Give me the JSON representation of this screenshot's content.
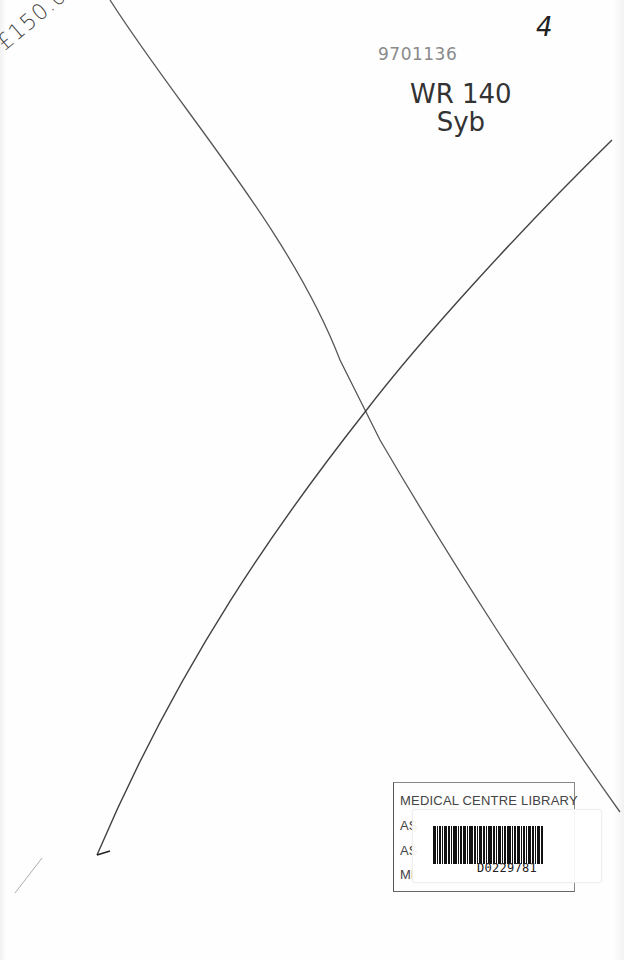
{
  "page": {
    "type": "book endpaper (cancelled blank page)",
    "background": "#fefefe",
    "ink_color": "#2a2a2a"
  },
  "handwriting": {
    "price": "£150.00",
    "accession_number": "9701136",
    "classmark_line1": "WR 140",
    "classmark_line2": "Syb",
    "page_number": "4"
  },
  "cross_lines": {
    "line1": {
      "from": [
        110,
        0
      ],
      "to": [
        620,
        812
      ]
    },
    "line2": {
      "from": [
        612,
        140
      ],
      "to": [
        97,
        855
      ]
    },
    "intersection": [
      365,
      412
    ]
  },
  "library_stamp": {
    "title": "MEDICAL CENTRE LIBRARY",
    "line2_visible": "AS",
    "line3_visible": "AS",
    "line4_visible": "MI"
  },
  "barcode": {
    "number": "D0229781"
  }
}
